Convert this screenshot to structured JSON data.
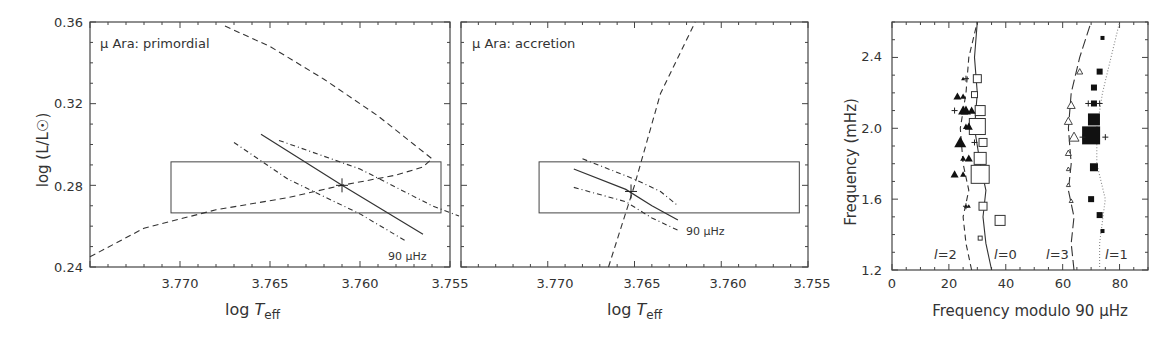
{
  "chart_data": [
    {
      "type": "line",
      "title": "μ Ara: primordial",
      "xlabel": "log T_eff",
      "ylabel": "log (L/L☉)",
      "xlim": [
        3.775,
        3.755
      ],
      "ylim": [
        0.24,
        0.36
      ],
      "xticks": [
        "3.770",
        "3.765",
        "3.760",
        "3.755"
      ],
      "yticks": [
        "0.24",
        "0.28",
        "0.32",
        "0.36"
      ],
      "grid": false,
      "error_box": {
        "x": [
          3.7705,
          3.7555
        ],
        "y": [
          0.2665,
          0.2915
        ]
      },
      "series": [
        {
          "name": "evolutionary track",
          "style": "dashed",
          "points": [
            [
              3.775,
              0.245
            ],
            [
              3.772,
              0.259
            ],
            [
              3.768,
              0.268
            ],
            [
              3.764,
              0.274
            ],
            [
              3.761,
              0.28
            ],
            [
              3.758,
              0.285
            ],
            [
              3.7565,
              0.289
            ],
            [
              3.756,
              0.293
            ],
            [
              3.757,
              0.3
            ],
            [
              3.759,
              0.314
            ],
            [
              3.762,
              0.332
            ],
            [
              3.765,
              0.348
            ],
            [
              3.7675,
              0.358
            ]
          ]
        },
        {
          "name": "90 μHz",
          "style": "solid",
          "points": [
            [
              3.7655,
              0.305
            ],
            [
              3.761,
              0.28
            ],
            [
              3.7565,
              0.256
            ]
          ]
        },
        {
          "name": "90 μHz upper bound",
          "style": "dashdot",
          "points": [
            [
              3.7645,
              0.302
            ],
            [
              3.76,
              0.288
            ],
            [
              3.756,
              0.27
            ],
            [
              3.7545,
              0.265
            ]
          ]
        },
        {
          "name": "90 μHz lower bound",
          "style": "dashdot",
          "points": [
            [
              3.767,
              0.301
            ],
            [
              3.764,
              0.283
            ],
            [
              3.76,
              0.266
            ],
            [
              3.7575,
              0.253
            ]
          ]
        }
      ],
      "marker": {
        "label": "+",
        "x": 3.761,
        "y": 0.28
      },
      "annotation": "90 μHz"
    },
    {
      "type": "line",
      "title": "μ Ara: accretion",
      "xlabel": "log T_eff",
      "ylabel": "",
      "xlim": [
        3.775,
        3.755
      ],
      "ylim": [
        0.24,
        0.36
      ],
      "xticks": [
        "3.770",
        "3.765",
        "3.760",
        "3.755"
      ],
      "grid": false,
      "error_box": {
        "x": [
          3.7705,
          3.7555
        ],
        "y": [
          0.2665,
          0.2915
        ]
      },
      "series": [
        {
          "name": "evolutionary track",
          "style": "dashed",
          "points": [
            [
              3.7665,
              0.24
            ],
            [
              3.765,
              0.28
            ],
            [
              3.7635,
              0.325
            ],
            [
              3.7615,
              0.36
            ]
          ]
        },
        {
          "name": "90 μHz",
          "style": "solid",
          "points": [
            [
              3.7685,
              0.288
            ],
            [
              3.7655,
              0.278
            ],
            [
              3.764,
              0.27
            ],
            [
              3.7625,
              0.263
            ]
          ]
        },
        {
          "name": "90 μHz upper bound",
          "style": "dashdot",
          "points": [
            [
              3.768,
              0.293
            ],
            [
              3.765,
              0.283
            ],
            [
              3.7635,
              0.277
            ],
            [
              3.7625,
              0.27
            ]
          ]
        },
        {
          "name": "90 μHz lower bound",
          "style": "dashdot",
          "points": [
            [
              3.7685,
              0.279
            ],
            [
              3.7655,
              0.272
            ],
            [
              3.764,
              0.264
            ],
            [
              3.7625,
              0.258
            ]
          ]
        }
      ],
      "marker": {
        "label": "+",
        "x": 3.7652,
        "y": 0.277
      },
      "annotation": "90 μHz"
    },
    {
      "type": "scatter",
      "title": "",
      "xlabel": "Frequency modulo 90 μHz",
      "ylabel": "Frequency (mHz)",
      "xlim": [
        0,
        90
      ],
      "ylim": [
        1.2,
        2.6
      ],
      "xticks": [
        "0",
        "20",
        "40",
        "60",
        "80"
      ],
      "yticks": [
        "1.2",
        "1.6",
        "2.0",
        "2.4"
      ],
      "grid": false,
      "labels": [
        "l=2",
        "l=0",
        "l=3",
        "l=1"
      ],
      "series": [
        {
          "name": "l=0 model",
          "style": "solid",
          "points": [
            [
              35,
              1.2
            ],
            [
              33,
              1.35
            ],
            [
              32,
              1.5
            ],
            [
              33,
              1.65
            ],
            [
              31,
              1.8
            ],
            [
              29,
              2.0
            ],
            [
              30,
              2.2
            ],
            [
              29,
              2.4
            ],
            [
              30,
              2.6
            ]
          ]
        },
        {
          "name": "l=2 model",
          "style": "dashed",
          "points": [
            [
              28,
              1.2
            ],
            [
              26,
              1.35
            ],
            [
              25,
              1.5
            ],
            [
              27,
              1.65
            ],
            [
              25,
              1.8
            ],
            [
              24,
              2.0
            ],
            [
              26,
              2.2
            ],
            [
              27,
              2.4
            ],
            [
              30,
              2.6
            ]
          ]
        },
        {
          "name": "l=3 model",
          "style": "longdash",
          "points": [
            [
              64,
              1.2
            ],
            [
              63,
              1.35
            ],
            [
              64,
              1.5
            ],
            [
              62,
              1.65
            ],
            [
              63,
              1.8
            ],
            [
              62,
              2.0
            ],
            [
              63,
              2.2
            ],
            [
              66,
              2.4
            ],
            [
              70,
              2.6
            ]
          ]
        },
        {
          "name": "l=1 model",
          "style": "dotted",
          "points": [
            [
              73,
              1.2
            ],
            [
              73,
              1.35
            ],
            [
              75,
              1.6
            ],
            [
              72,
              1.8
            ],
            [
              72,
              2.0
            ],
            [
              74,
              2.2
            ],
            [
              77,
              2.4
            ],
            [
              80,
              2.6
            ]
          ]
        },
        {
          "name": "l=0 observed",
          "marker": "open-square",
          "points": [
            [
              31,
              1.38,
              2
            ],
            [
              38,
              1.48,
              5
            ],
            [
              32,
              1.56,
              4
            ],
            [
              31,
              1.74,
              9
            ],
            [
              31,
              1.83,
              6
            ],
            [
              32,
              1.92,
              4
            ],
            [
              30,
              2.01,
              8
            ],
            [
              31,
              2.1,
              5
            ],
            [
              29,
              2.19,
              3
            ],
            [
              30,
              2.28,
              4
            ]
          ]
        },
        {
          "name": "l=2 observed",
          "marker": "filled-triangle",
          "points": [
            [
              26,
              1.56,
              2
            ],
            [
              27,
              1.56,
              2
            ],
            [
              22,
              1.74,
              4
            ],
            [
              25,
              1.74,
              3
            ],
            [
              25,
              1.83,
              3
            ],
            [
              27,
              1.83,
              4
            ],
            [
              24,
              1.92,
              6
            ],
            [
              26,
              2.01,
              3
            ],
            [
              27,
              2.01,
              4
            ],
            [
              25,
              2.1,
              5
            ],
            [
              26,
              2.1,
              5
            ],
            [
              28,
              2.1,
              4
            ],
            [
              23,
              2.18,
              4
            ],
            [
              25,
              2.18,
              3
            ],
            [
              25,
              2.28,
              2
            ]
          ]
        },
        {
          "name": "l=3 observed",
          "marker": "open-triangle",
          "points": [
            [
              63,
              1.59,
              2
            ],
            [
              62,
              1.68,
              2
            ],
            [
              62,
              1.77,
              2
            ],
            [
              62,
              1.86,
              3
            ],
            [
              64,
              1.95,
              5
            ],
            [
              62,
              2.04,
              4
            ],
            [
              63,
              2.13,
              4
            ],
            [
              66,
              2.32,
              3
            ]
          ]
        },
        {
          "name": "l=1 observed",
          "marker": "filled-square",
          "points": [
            [
              74,
              1.42,
              2
            ],
            [
              73,
              1.51,
              3
            ],
            [
              70,
              1.6,
              3
            ],
            [
              71,
              1.78,
              4
            ],
            [
              70,
              1.96,
              9
            ],
            [
              71,
              2.05,
              6
            ],
            [
              71,
              2.14,
              3
            ],
            [
              71,
              2.23,
              3
            ],
            [
              73,
              2.32,
              3
            ],
            [
              74,
              2.51,
              2
            ]
          ]
        },
        {
          "name": "extra frequencies",
          "marker": "plus",
          "points": [
            [
              26,
              1.56
            ],
            [
              22,
              2.1
            ],
            [
              29,
              1.92
            ],
            [
              26,
              2.28
            ],
            [
              67,
              1.95
            ],
            [
              75,
              1.95
            ],
            [
              69,
              2.14
            ],
            [
              73,
              2.14
            ]
          ]
        }
      ]
    }
  ],
  "panels": {
    "p1": {
      "title": "μ Ara: primordial",
      "xlabel_main": "log ",
      "xlabel_italic": "T",
      "xlabel_sub": "eff",
      "ylabel": "log (L/L☉)",
      "annotation": "90 μHz"
    },
    "p2": {
      "title": "μ Ara: accretion",
      "xlabel_main": "log ",
      "xlabel_italic": "T",
      "xlabel_sub": "eff",
      "annotation": "90 μHz"
    },
    "p3": {
      "xlabel": "Frequency modulo 90 μHz",
      "ylabel": "Frequency (mHz)",
      "l2": "l",
      "l2v": "=2",
      "l0": "l",
      "l0v": "=0",
      "l3": "l",
      "l3v": "=3",
      "l1": "l",
      "l1v": "=1"
    }
  },
  "ticks": {
    "teff": [
      "3.770",
      "3.765",
      "3.760",
      "3.755"
    ],
    "logL": [
      "0.36",
      "0.32",
      "0.28",
      "0.24"
    ],
    "freqx": [
      "0",
      "20",
      "40",
      "60",
      "80"
    ],
    "freqy": [
      "2.4",
      "2.0",
      "1.6",
      "1.2"
    ]
  }
}
